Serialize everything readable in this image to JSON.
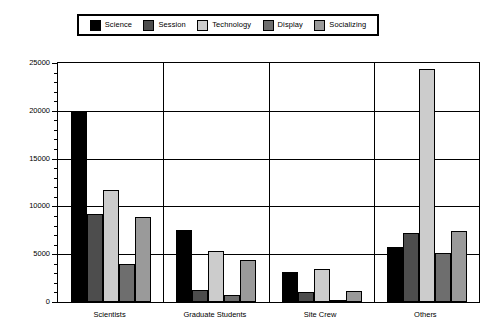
{
  "chart_data": {
    "type": "bar",
    "title": "",
    "subtitle": "",
    "xlabel": "",
    "ylabel": "",
    "grid": true,
    "legend_position": "top",
    "categories": [
      "Scientists",
      "Graduate Students",
      "Site Crew",
      "Others"
    ],
    "ylim": [
      0,
      25000
    ],
    "yticks": [
      0,
      5000,
      10000,
      15000,
      20000,
      25000
    ],
    "ytick_labels": [
      "0",
      "5000",
      "10000",
      "15000",
      "20000",
      "25000"
    ],
    "series": [
      {
        "name": "Science",
        "color": "#000000",
        "values": [
          19900,
          7500,
          3100,
          5800
        ]
      },
      {
        "name": "Session",
        "color": "#4d4d4d",
        "values": [
          9200,
          1300,
          1000,
          7200
        ]
      },
      {
        "name": "Technology",
        "color": "#cccccc",
        "values": [
          11700,
          5300,
          3500,
          24400
        ]
      },
      {
        "name": "Display",
        "color": "#6e6e6e",
        "values": [
          4000,
          700,
          200,
          5100
        ]
      },
      {
        "name": "Socializing",
        "color": "#9a9a9a",
        "values": [
          8900,
          4400,
          1200,
          7400
        ]
      }
    ]
  },
  "legend": {
    "items": [
      {
        "label": "Science"
      },
      {
        "label": "Session"
      },
      {
        "label": "Technology"
      },
      {
        "label": "Display"
      },
      {
        "label": "Socializing"
      }
    ]
  },
  "axes": {
    "y": {
      "labels": [
        "25000",
        "20000",
        "15000",
        "10000",
        "5000",
        "0"
      ]
    },
    "x": {
      "labels": [
        "Scientists",
        "Graduate Students",
        "Site Crew",
        "Others"
      ]
    }
  }
}
